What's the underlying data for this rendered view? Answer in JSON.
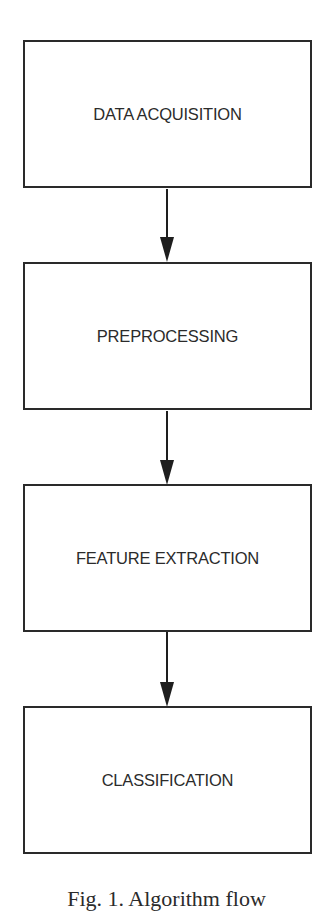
{
  "diagram": {
    "type": "flowchart",
    "direction": "top-to-bottom",
    "stroke_color": "#2a2a2a",
    "text_color": "#2b2b2b",
    "background": "#ffffff",
    "nodes": [
      {
        "id": "n1",
        "label": "DATA ACQUISITION"
      },
      {
        "id": "n2",
        "label": "PREPROCESSING"
      },
      {
        "id": "n3",
        "label": "FEATURE EXTRACTION"
      },
      {
        "id": "n4",
        "label": "CLASSIFICATION"
      }
    ],
    "edges": [
      {
        "from": "n1",
        "to": "n2"
      },
      {
        "from": "n2",
        "to": "n3"
      },
      {
        "from": "n3",
        "to": "n4"
      }
    ],
    "caption": "Fig. 1. Algorithm flow"
  }
}
